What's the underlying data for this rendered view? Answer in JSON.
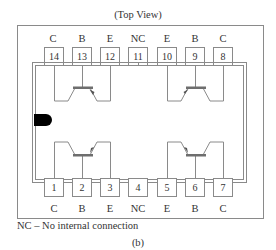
{
  "title": "(Top View)",
  "top_pins": [
    {
      "number": "14",
      "function": "C"
    },
    {
      "number": "13",
      "function": "B"
    },
    {
      "number": "12",
      "function": "E"
    },
    {
      "number": "11",
      "function": "NC"
    },
    {
      "number": "10",
      "function": "E"
    },
    {
      "number": "9",
      "function": "B"
    },
    {
      "number": "8",
      "function": "C"
    }
  ],
  "bottom_pins": [
    {
      "number": "1",
      "function": "C"
    },
    {
      "number": "2",
      "function": "B"
    },
    {
      "number": "3",
      "function": "E"
    },
    {
      "number": "4",
      "function": "NC"
    },
    {
      "number": "5",
      "function": "E"
    },
    {
      "number": "6",
      "function": "B"
    },
    {
      "number": "7",
      "function": "C"
    }
  ],
  "legend": "NC – No internal connection",
  "figure_label": "(b)",
  "colors": {
    "line": "#8a8a8a",
    "text": "#333333",
    "notch": "#000000"
  }
}
